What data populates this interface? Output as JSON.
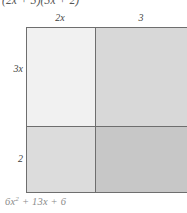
{
  "figure": {
    "type": "area-model-binomial-multiplication",
    "problem_expression": "(2x + 3)(3x + 2)",
    "answer_expression": "6x² + 13x + 6",
    "answer_parts": {
      "coefficient_squared": "6x",
      "exponent": "2",
      "rest": " + 13x + 6"
    },
    "column_labels": [
      "2x",
      "3"
    ],
    "row_labels": [
      "3x",
      "2"
    ],
    "cells": [
      {
        "name": "top-left",
        "fill": "#f1f1f1",
        "row": "3x",
        "col": "2x"
      },
      {
        "name": "top-right",
        "fill": "#d8d8d8",
        "row": "3x",
        "col": "3"
      },
      {
        "name": "bottom-left",
        "fill": "#dcdcdc",
        "row": "2",
        "col": "2x"
      },
      {
        "name": "bottom-right",
        "fill": "#c7c7c7",
        "row": "2",
        "col": "3"
      }
    ],
    "colors": {
      "border": "#6e6e6e",
      "label_text": "#3f3f3f",
      "answer_text": "#8b8b8b",
      "problem_text": "#555555",
      "background": "#ffffff"
    }
  }
}
